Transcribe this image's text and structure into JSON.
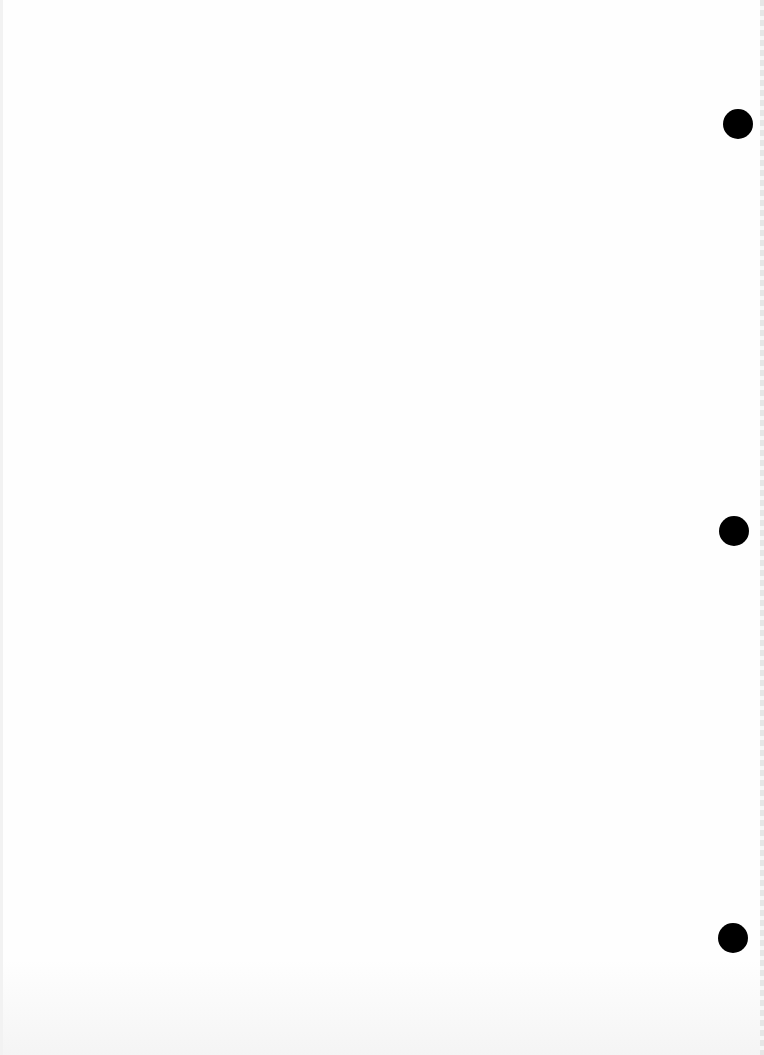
{
  "document": {
    "type": "blank scanned page",
    "text": ""
  },
  "punch_holes": [
    {
      "cx": 738,
      "cy": 124,
      "r": 15
    },
    {
      "cx": 734,
      "cy": 531,
      "r": 15
    },
    {
      "cx": 733,
      "cy": 938,
      "r": 15
    }
  ],
  "colors": {
    "paper": "#fefefe",
    "hole": "#000000"
  }
}
